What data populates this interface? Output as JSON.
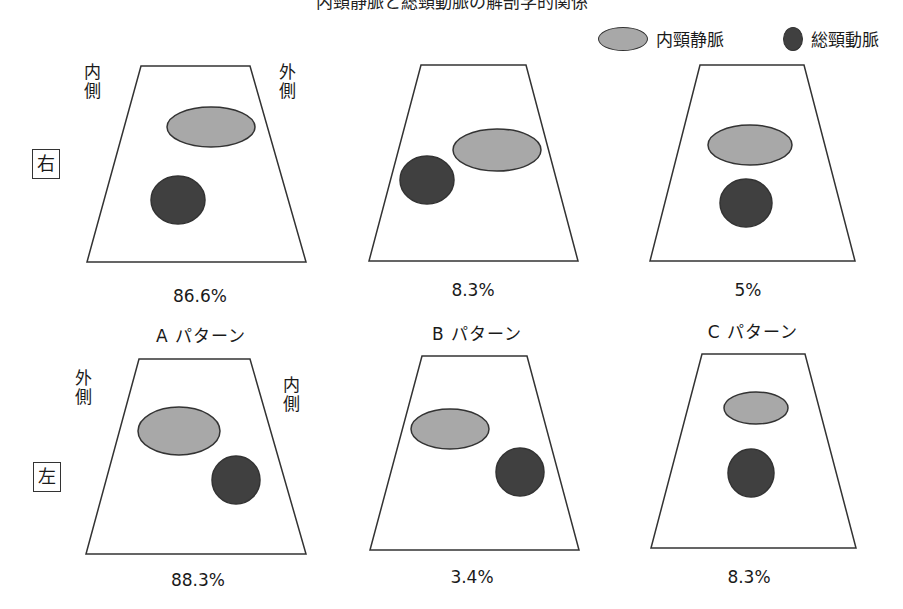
{
  "title": "内頸静脈と総頸動脈の解剖学的関係",
  "legend": {
    "vein": {
      "label": "内頸静脈",
      "color": "#a8a8a8"
    },
    "artery": {
      "label": "総頸動脈",
      "color": "#404040"
    }
  },
  "rows": {
    "right": {
      "side_label": "右",
      "left_label": [
        "内",
        "側"
      ],
      "right_label": [
        "外",
        "側"
      ],
      "percentages": [
        "86.6%",
        "8.3%",
        "5%"
      ]
    },
    "left": {
      "side_label": "左",
      "left_label": [
        "外",
        "側"
      ],
      "right_label": [
        "内",
        "側"
      ],
      "percentages": [
        "88.3%",
        "3.4%",
        "8.3%"
      ]
    }
  },
  "patterns": [
    "A パターン",
    "B パターン",
    "C パターン"
  ],
  "colors": {
    "outline": "#333333",
    "vein_fill": "#a8a8a8",
    "artery_fill": "#404040"
  }
}
